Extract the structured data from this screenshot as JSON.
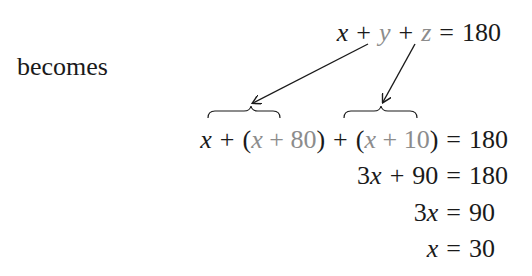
{
  "label_becomes": "becomes",
  "equations": {
    "original": {
      "t1": "x",
      "op1": "+",
      "t2": "y",
      "op2": "+",
      "t3": "z",
      "eq": "=",
      "rhs": "180"
    },
    "substituted": {
      "t1": "x",
      "op1": "+",
      "lp1": "(",
      "s1": "x + 80",
      "rp1": ")",
      "op2": "+",
      "lp2": "(",
      "s2": "x + 10",
      "rp2": ")",
      "eq": "=",
      "rhs": "180"
    },
    "combined": {
      "lhs_coef": "3",
      "lhs_var": "x",
      "op": "+",
      "const": "90",
      "eq": "=",
      "rhs": "180"
    },
    "subtracted": {
      "coef": "3",
      "var": "x",
      "eq": "=",
      "rhs": "90"
    },
    "solution": {
      "var": "x",
      "eq": "=",
      "rhs": "30"
    }
  },
  "annotations": {
    "arrow_y_to": "x + 80",
    "arrow_z_to": "x + 10"
  },
  "colors": {
    "text": "#1a1a1a",
    "substituted": "#8c8c8c"
  }
}
